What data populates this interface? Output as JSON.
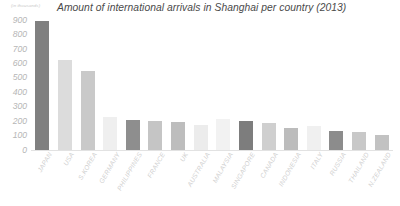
{
  "chart_data": {
    "type": "bar",
    "title": "Amount of international arrivals in Shanghai per country (2013)",
    "xlabel": "",
    "ylabel": "(in thousands)",
    "ylim": [
      0,
      900
    ],
    "yticks": [
      900,
      800,
      700,
      600,
      500,
      400,
      300,
      200,
      100,
      0
    ],
    "ytick_labels": [
      "900",
      "800",
      "700",
      "600",
      "500",
      "400",
      "300",
      "200",
      "100",
      "0"
    ],
    "grid": false,
    "legend": "none",
    "categories": [
      "JAPAN",
      "USA",
      "S.KOREA",
      "GERMANY",
      "PHILIPPINES",
      "FRANCE",
      "UK",
      "AUSTRALIA",
      "MALAYSIA",
      "SINGAPORE",
      "CANADA",
      "INDONESIA",
      "ITALY",
      "RUSSIA",
      "THAILAND",
      "N.ZEALAND"
    ],
    "values": [
      890,
      620,
      545,
      230,
      205,
      200,
      195,
      175,
      215,
      200,
      185,
      150,
      165,
      130,
      125,
      105
    ],
    "bar_colors": [
      "#808080",
      "#dcdcdc",
      "#c9c9c9",
      "#efefef",
      "#8e8e8e",
      "#c5c5c5",
      "#bdbdbd",
      "#ececec",
      "#f2f2f2",
      "#7d7d7d",
      "#cfcfcf",
      "#bcbcbc",
      "#f0f0f0",
      "#8c8c8c",
      "#c8c8c8",
      "#c2c2c2"
    ]
  },
  "axis": {
    "unit_caption": "(in thousands)"
  },
  "colors": {
    "title": "#4a4a4a",
    "tick": "#b6b6b6",
    "category_label": "#cfcfcf",
    "baseline": "#e2e2e2",
    "background": "#ffffff"
  }
}
